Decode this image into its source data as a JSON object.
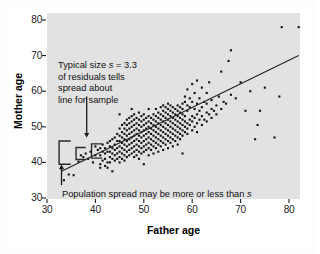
{
  "figure": {
    "kind": "scatterplot-with-regression-line",
    "background_color": "#ffffff",
    "plot_background_color": "#e2e2e2",
    "point_color": "#111111",
    "line_color": "#222222",
    "annotation_color": "#111111"
  },
  "annotations": {
    "top_note": {
      "line1_pre": "Typical size ",
      "line1_italic": "s",
      "line1_post": " = 3.3",
      "line2": "of residuals tells",
      "line3": "spread about",
      "line4": "line for sample"
    },
    "bottom_note": {
      "text_pre": "Population spread may be more or less than ",
      "text_italic": "s"
    }
  },
  "chart_data": {
    "type": "scatter",
    "title": "",
    "xlabel": "Father age",
    "ylabel": "Mother age",
    "xlim": [
      30,
      82
    ],
    "ylim": [
      30,
      82
    ],
    "xticks": [
      30,
      40,
      50,
      60,
      70,
      80
    ],
    "yticks": [
      30,
      40,
      50,
      60,
      70,
      80
    ],
    "xtick_labels": [
      "30",
      "40",
      "50",
      "60",
      "70",
      "80"
    ],
    "ytick_labels": [
      "30",
      "40",
      "50",
      "60",
      "70",
      "80"
    ],
    "grid": false,
    "legend": null,
    "residual_sd_s": 3.3,
    "regression_line": {
      "x": [
        33,
        82
      ],
      "y": [
        37.5,
        70.0
      ],
      "slope": 0.663,
      "intercept": 15.6
    },
    "points": [
      [
        33.5,
        35.0
      ],
      [
        34.5,
        36.6
      ],
      [
        35.5,
        36.4
      ],
      [
        36.5,
        40.2
      ],
      [
        37.0,
        42.0
      ],
      [
        37.5,
        41.5
      ],
      [
        38.0,
        42.5
      ],
      [
        38.5,
        41.0
      ],
      [
        39.0,
        43.0
      ],
      [
        39.5,
        40.0
      ],
      [
        40.0,
        42.0
      ],
      [
        40.0,
        44.5
      ],
      [
        40.5,
        43.5
      ],
      [
        41.0,
        38.5
      ],
      [
        41.0,
        39.5
      ],
      [
        41.0,
        42.0
      ],
      [
        41.0,
        44.0
      ],
      [
        41.5,
        40.5
      ],
      [
        41.5,
        43.0
      ],
      [
        41.5,
        45.0
      ],
      [
        42.0,
        39.0
      ],
      [
        42.0,
        41.0
      ],
      [
        42.0,
        42.5
      ],
      [
        42.0,
        44.0
      ],
      [
        42.5,
        38.5
      ],
      [
        42.5,
        40.0
      ],
      [
        42.5,
        43.0
      ],
      [
        42.5,
        45.5
      ],
      [
        43.0,
        40.0
      ],
      [
        43.0,
        41.5
      ],
      [
        43.0,
        43.0
      ],
      [
        43.0,
        44.5
      ],
      [
        43.0,
        46.0
      ],
      [
        43.5,
        37.5
      ],
      [
        43.5,
        41.0
      ],
      [
        43.5,
        42.5
      ],
      [
        43.5,
        44.0
      ],
      [
        43.5,
        46.5
      ],
      [
        44.0,
        40.5
      ],
      [
        44.0,
        42.0
      ],
      [
        44.0,
        43.5
      ],
      [
        44.0,
        45.0
      ],
      [
        44.0,
        47.0
      ],
      [
        44.5,
        41.0
      ],
      [
        44.5,
        42.5
      ],
      [
        44.5,
        44.0
      ],
      [
        44.5,
        46.0
      ],
      [
        44.5,
        48.0
      ],
      [
        45.0,
        40.0
      ],
      [
        45.0,
        41.5
      ],
      [
        45.0,
        43.0
      ],
      [
        45.0,
        44.5
      ],
      [
        45.0,
        46.0
      ],
      [
        45.0,
        47.5
      ],
      [
        45.0,
        49.5
      ],
      [
        45.0,
        53.5
      ],
      [
        45.5,
        41.0
      ],
      [
        45.5,
        42.5
      ],
      [
        45.5,
        44.0
      ],
      [
        45.5,
        45.5
      ],
      [
        45.5,
        47.0
      ],
      [
        45.5,
        48.5
      ],
      [
        45.5,
        50.5
      ],
      [
        46.0,
        40.5
      ],
      [
        46.0,
        42.0
      ],
      [
        46.0,
        43.5
      ],
      [
        46.0,
        45.0
      ],
      [
        46.0,
        46.5
      ],
      [
        46.0,
        48.0
      ],
      [
        46.0,
        49.5
      ],
      [
        46.0,
        51.0
      ],
      [
        46.5,
        41.5
      ],
      [
        46.5,
        43.0
      ],
      [
        46.5,
        44.5
      ],
      [
        46.5,
        46.0
      ],
      [
        46.5,
        47.5
      ],
      [
        46.5,
        49.0
      ],
      [
        46.5,
        50.5
      ],
      [
        46.5,
        52.0
      ],
      [
        47.0,
        42.0
      ],
      [
        47.0,
        43.5
      ],
      [
        47.0,
        45.0
      ],
      [
        47.0,
        46.5
      ],
      [
        47.0,
        48.0
      ],
      [
        47.0,
        49.5
      ],
      [
        47.0,
        51.0
      ],
      [
        47.0,
        52.5
      ],
      [
        47.5,
        42.5
      ],
      [
        47.5,
        44.0
      ],
      [
        47.5,
        45.5
      ],
      [
        47.5,
        47.0
      ],
      [
        47.5,
        48.5
      ],
      [
        47.5,
        50.0
      ],
      [
        47.5,
        51.5
      ],
      [
        47.5,
        53.0
      ],
      [
        47.5,
        55.0
      ],
      [
        48.0,
        41.5
      ],
      [
        48.0,
        43.0
      ],
      [
        48.0,
        44.5
      ],
      [
        48.0,
        46.0
      ],
      [
        48.0,
        47.5
      ],
      [
        48.0,
        49.0
      ],
      [
        48.0,
        50.5
      ],
      [
        48.0,
        52.0
      ],
      [
        48.0,
        53.5
      ],
      [
        48.5,
        42.0
      ],
      [
        48.5,
        43.5
      ],
      [
        48.5,
        45.0
      ],
      [
        48.5,
        46.5
      ],
      [
        48.5,
        48.0
      ],
      [
        48.5,
        49.5
      ],
      [
        48.5,
        51.0
      ],
      [
        48.5,
        52.5
      ],
      [
        49.0,
        41.0
      ],
      [
        49.0,
        43.0
      ],
      [
        49.0,
        44.5
      ],
      [
        49.0,
        46.0
      ],
      [
        49.0,
        47.5
      ],
      [
        49.0,
        49.0
      ],
      [
        49.0,
        50.5
      ],
      [
        49.0,
        52.0
      ],
      [
        49.0,
        54.0
      ],
      [
        49.5,
        42.5
      ],
      [
        49.5,
        44.0
      ],
      [
        49.5,
        45.5
      ],
      [
        49.5,
        47.0
      ],
      [
        49.5,
        48.5
      ],
      [
        49.5,
        50.0
      ],
      [
        49.5,
        51.5
      ],
      [
        49.5,
        53.0
      ],
      [
        50.0,
        39.5
      ],
      [
        50.0,
        43.0
      ],
      [
        50.0,
        44.5
      ],
      [
        50.0,
        46.0
      ],
      [
        50.0,
        47.5
      ],
      [
        50.0,
        49.0
      ],
      [
        50.0,
        50.5
      ],
      [
        50.0,
        52.0
      ],
      [
        50.0,
        53.5
      ],
      [
        50.5,
        43.5
      ],
      [
        50.5,
        45.0
      ],
      [
        50.5,
        46.5
      ],
      [
        50.5,
        48.0
      ],
      [
        50.5,
        49.5
      ],
      [
        50.5,
        51.0
      ],
      [
        50.5,
        52.5
      ],
      [
        51.0,
        42.0
      ],
      [
        51.0,
        44.0
      ],
      [
        51.0,
        45.5
      ],
      [
        51.0,
        47.0
      ],
      [
        51.0,
        48.5
      ],
      [
        51.0,
        50.0
      ],
      [
        51.0,
        51.5
      ],
      [
        51.0,
        53.0
      ],
      [
        51.0,
        55.0
      ],
      [
        51.5,
        43.5
      ],
      [
        51.5,
        45.0
      ],
      [
        51.5,
        46.5
      ],
      [
        51.5,
        48.0
      ],
      [
        51.5,
        49.5
      ],
      [
        51.5,
        51.0
      ],
      [
        51.5,
        52.5
      ],
      [
        52.0,
        42.5
      ],
      [
        52.0,
        44.5
      ],
      [
        52.0,
        46.0
      ],
      [
        52.0,
        47.5
      ],
      [
        52.0,
        49.0
      ],
      [
        52.0,
        50.5
      ],
      [
        52.0,
        52.0
      ],
      [
        52.0,
        53.5
      ],
      [
        52.5,
        44.0
      ],
      [
        52.5,
        45.5
      ],
      [
        52.5,
        47.0
      ],
      [
        52.5,
        48.5
      ],
      [
        52.5,
        50.0
      ],
      [
        52.5,
        51.5
      ],
      [
        52.5,
        53.0
      ],
      [
        52.5,
        55.0
      ],
      [
        53.0,
        43.0
      ],
      [
        53.0,
        45.0
      ],
      [
        53.0,
        46.5
      ],
      [
        53.0,
        48.0
      ],
      [
        53.0,
        49.5
      ],
      [
        53.0,
        51.0
      ],
      [
        53.0,
        52.5
      ],
      [
        53.0,
        54.0
      ],
      [
        53.5,
        44.5
      ],
      [
        53.5,
        46.0
      ],
      [
        53.5,
        47.5
      ],
      [
        53.5,
        49.0
      ],
      [
        53.5,
        50.5
      ],
      [
        53.5,
        52.0
      ],
      [
        53.5,
        53.5
      ],
      [
        53.5,
        55.5
      ],
      [
        54.0,
        43.5
      ],
      [
        54.0,
        45.5
      ],
      [
        54.0,
        47.0
      ],
      [
        54.0,
        48.5
      ],
      [
        54.0,
        50.0
      ],
      [
        54.0,
        51.5
      ],
      [
        54.0,
        53.0
      ],
      [
        54.0,
        54.5
      ],
      [
        54.0,
        56.0
      ],
      [
        54.5,
        45.0
      ],
      [
        54.5,
        46.5
      ],
      [
        54.5,
        48.0
      ],
      [
        54.5,
        49.5
      ],
      [
        54.5,
        51.0
      ],
      [
        54.5,
        52.5
      ],
      [
        54.5,
        54.0
      ],
      [
        54.5,
        55.5
      ],
      [
        55.0,
        44.0
      ],
      [
        55.0,
        46.0
      ],
      [
        55.0,
        47.5
      ],
      [
        55.0,
        49.0
      ],
      [
        55.0,
        50.5
      ],
      [
        55.0,
        52.0
      ],
      [
        55.0,
        53.5
      ],
      [
        55.0,
        55.0
      ],
      [
        55.0,
        56.5
      ],
      [
        55.5,
        45.5
      ],
      [
        55.5,
        47.0
      ],
      [
        55.5,
        48.5
      ],
      [
        55.5,
        50.0
      ],
      [
        55.5,
        51.5
      ],
      [
        55.5,
        53.0
      ],
      [
        55.5,
        54.5
      ],
      [
        55.5,
        56.0
      ],
      [
        56.0,
        44.5
      ],
      [
        56.0,
        46.5
      ],
      [
        56.0,
        48.0
      ],
      [
        56.0,
        49.5
      ],
      [
        56.0,
        51.0
      ],
      [
        56.0,
        52.5
      ],
      [
        56.0,
        54.0
      ],
      [
        56.0,
        55.5
      ],
      [
        56.5,
        46.0
      ],
      [
        56.5,
        47.5
      ],
      [
        56.5,
        49.0
      ],
      [
        56.5,
        50.5
      ],
      [
        56.5,
        52.0
      ],
      [
        56.5,
        53.5
      ],
      [
        56.5,
        55.0
      ],
      [
        57.0,
        45.0
      ],
      [
        57.0,
        47.0
      ],
      [
        57.0,
        48.5
      ],
      [
        57.0,
        50.0
      ],
      [
        57.0,
        51.5
      ],
      [
        57.0,
        53.0
      ],
      [
        57.0,
        54.5
      ],
      [
        57.0,
        56.0
      ],
      [
        57.5,
        46.5
      ],
      [
        57.5,
        48.0
      ],
      [
        57.5,
        49.5
      ],
      [
        57.5,
        51.0
      ],
      [
        57.5,
        52.5
      ],
      [
        57.5,
        54.0
      ],
      [
        57.5,
        55.5
      ],
      [
        58.0,
        42.5
      ],
      [
        58.0,
        47.5
      ],
      [
        58.0,
        49.0
      ],
      [
        58.0,
        50.5
      ],
      [
        58.0,
        52.0
      ],
      [
        58.0,
        53.5
      ],
      [
        58.0,
        55.0
      ],
      [
        58.0,
        56.5
      ],
      [
        58.5,
        48.5
      ],
      [
        58.5,
        50.0
      ],
      [
        58.5,
        51.5
      ],
      [
        58.5,
        53.0
      ],
      [
        58.5,
        57.0
      ],
      [
        58.5,
        58.5
      ],
      [
        59.0,
        48.0
      ],
      [
        59.0,
        49.5
      ],
      [
        59.0,
        51.0
      ],
      [
        59.0,
        54.5
      ],
      [
        59.0,
        56.0
      ],
      [
        59.0,
        60.5
      ],
      [
        59.5,
        50.5
      ],
      [
        59.5,
        52.0
      ],
      [
        59.5,
        55.5
      ],
      [
        59.5,
        58.0
      ],
      [
        60.0,
        49.0
      ],
      [
        60.0,
        51.5
      ],
      [
        60.0,
        53.0
      ],
      [
        60.0,
        57.0
      ],
      [
        60.0,
        62.0
      ],
      [
        60.5,
        50.0
      ],
      [
        60.5,
        52.5
      ],
      [
        60.5,
        55.0
      ],
      [
        60.5,
        59.5
      ],
      [
        61.0,
        48.5
      ],
      [
        61.0,
        51.0
      ],
      [
        61.0,
        53.5
      ],
      [
        61.0,
        56.5
      ],
      [
        61.0,
        63.0
      ],
      [
        61.5,
        52.0
      ],
      [
        61.5,
        54.5
      ],
      [
        61.5,
        58.0
      ],
      [
        62.0,
        50.5
      ],
      [
        62.0,
        53.0
      ],
      [
        62.0,
        55.5
      ],
      [
        62.0,
        61.0
      ],
      [
        62.5,
        52.0
      ],
      [
        62.5,
        57.0
      ],
      [
        63.0,
        51.5
      ],
      [
        63.0,
        54.0
      ],
      [
        63.0,
        56.5
      ],
      [
        63.0,
        59.5
      ],
      [
        63.5,
        53.5
      ],
      [
        63.5,
        62.5
      ],
      [
        64.0,
        52.5
      ],
      [
        64.0,
        55.0
      ],
      [
        64.0,
        57.5
      ],
      [
        64.5,
        54.5
      ],
      [
        65.0,
        53.5
      ],
      [
        65.0,
        56.0
      ],
      [
        65.5,
        58.5
      ],
      [
        66.0,
        55.0
      ],
      [
        66.0,
        65.5
      ],
      [
        66.5,
        57.0
      ],
      [
        67.0,
        56.5
      ],
      [
        67.5,
        68.5
      ],
      [
        68.0,
        59.0
      ],
      [
        68.0,
        71.5
      ],
      [
        69.0,
        58.0
      ],
      [
        70.0,
        62.5
      ],
      [
        71.0,
        54.5
      ],
      [
        72.0,
        60.0
      ],
      [
        73.0,
        46.5
      ],
      [
        73.5,
        50.5
      ],
      [
        74.0,
        54.5
      ],
      [
        75.0,
        61.0
      ],
      [
        77.0,
        47.0
      ],
      [
        78.0,
        58.5
      ],
      [
        78.5,
        78.0
      ],
      [
        82.0,
        78.0
      ]
    ]
  },
  "brackets": [
    {
      "x_center": 32.5,
      "y_top": 46.0,
      "y_bottom": 39.5,
      "arm": 2.4
    },
    {
      "x_center": 36.0,
      "y_top": 44.2,
      "y_bottom": 40.8,
      "arm": 2.0
    },
    {
      "x_center": 39.2,
      "y_top": 45.2,
      "y_bottom": 41.2,
      "arm": 2.2
    }
  ],
  "arrows": [
    {
      "name": "arrow-to-top-note",
      "x": 38.2,
      "y_from": 58.5,
      "y_to": 47.0,
      "direction": "down"
    },
    {
      "name": "arrow-to-bottom-note",
      "x": 33.0,
      "y_from": 33.6,
      "y_to": 39.4,
      "direction": "up"
    }
  ]
}
